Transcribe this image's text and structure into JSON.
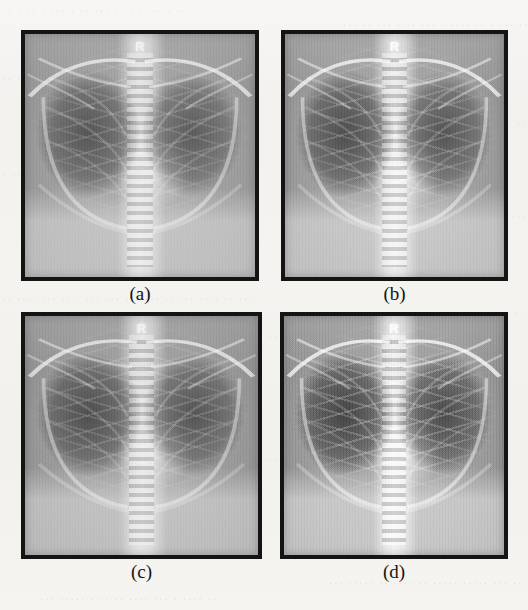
{
  "figure": {
    "kind": "scanned-journal-figure",
    "page_background_color": "#f3f2ef",
    "frame_color": "#141414",
    "label_color": "#141414",
    "panels": [
      {
        "id": "a",
        "label": "(a)",
        "image_kind": "chest-radiograph",
        "orientation_marker": "R",
        "x": 21,
        "y": 30,
        "w": 238,
        "h": 251,
        "label_x": 21,
        "label_y": 284,
        "label_w": 238,
        "processing": "proc-a"
      },
      {
        "id": "b",
        "label": "(b)",
        "image_kind": "chest-radiograph",
        "orientation_marker": "R",
        "x": 281,
        "y": 30,
        "w": 227,
        "h": 251,
        "label_x": 281,
        "label_y": 284,
        "label_w": 227,
        "processing": "proc-b"
      },
      {
        "id": "c",
        "label": "(c)",
        "image_kind": "chest-radiograph",
        "orientation_marker": "R",
        "x": 21,
        "y": 312,
        "w": 241,
        "h": 247,
        "label_x": 21,
        "label_y": 562,
        "label_w": 241,
        "processing": "proc-c"
      },
      {
        "id": "d",
        "label": "(d)",
        "image_kind": "chest-radiograph",
        "orientation_marker": "R",
        "x": 280,
        "y": 312,
        "w": 228,
        "h": 247,
        "label_x": 280,
        "label_y": 562,
        "label_w": 228,
        "processing": "proc-d"
      }
    ]
  },
  "background_ghost_text": {
    "note": "faint scanner bleed-through from the printed page behind the figure; illegible",
    "lines": [
      {
        "top": 4,
        "left": 8,
        "text": "·   ·  ··   ·   ···  ·  ··   ··· ·   ··  ·  ···   · ··"
      },
      {
        "top": 18,
        "left": 0,
        "text": "··  ···   ·  ··  ····  ·  ···  ··   · ···  ··  ···"
      },
      {
        "top": 72,
        "left": 2,
        "text": "··   ·"
      },
      {
        "top": 116,
        "left": 2,
        "text": "··  ···"
      },
      {
        "top": 168,
        "left": 2,
        "text": "·  ··"
      },
      {
        "top": 210,
        "left": 2,
        "text": "···"
      },
      {
        "top": 292,
        "left": 2,
        "text": "·· ···· ···  ··  · ···  ··· ··  ····  ·· ···  ····  ·· ···"
      },
      {
        "top": 306,
        "left": 10,
        "text": "·  ···  ··  ····   ··  · ···  ···  ··  ···  ··"
      },
      {
        "top": 330,
        "left": 268,
        "text": "··  ···  ··"
      },
      {
        "top": 376,
        "left": 266,
        "text": "· ····  ··"
      },
      {
        "top": 452,
        "left": 268,
        "text": "···  ··"
      },
      {
        "top": 576,
        "left": 6,
        "text": "·· ··· ·····  ·····   ··   ···· ··   ·····   ···"
      },
      {
        "top": 592,
        "left": 40,
        "text": "···  ····· · ··  ··  ····  ···  · ····  ··"
      }
    ]
  }
}
